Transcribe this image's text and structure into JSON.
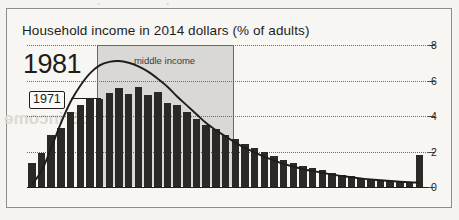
{
  "artifacts": {
    "bleed_top": "· ·",
    "bleed_middle": "ape-shifting US income distrib"
  },
  "frame": {
    "name": "scanned-figure-frame"
  },
  "chart_data": {
    "type": "bar",
    "title": "Household income in 2014 dollars (% of adults)",
    "xlabel": "",
    "ylabel": "",
    "ylim": [
      0,
      8
    ],
    "yticks": [
      0,
      2,
      4,
      6,
      8
    ],
    "grid": true,
    "legend_position": "inline-annotation",
    "annotations": [
      {
        "text": "1981",
        "role": "primary-series-label"
      },
      {
        "text": "1971",
        "role": "secondary-series-label"
      },
      {
        "text": "middle income",
        "role": "shaded-band-label"
      }
    ],
    "xtick_labels": [
      "$0k",
      "$50k",
      "$100k",
      "$150k",
      "$200k+"
    ],
    "xtick_values": [
      0,
      50,
      100,
      150,
      200
    ],
    "xlim": [
      0,
      207
    ],
    "band": {
      "label": "middle income",
      "x_start": 36,
      "x_end": 106
    },
    "series": [
      {
        "name": "1981",
        "type": "bar",
        "bin_width": 5,
        "x": [
          0,
          5,
          10,
          15,
          20,
          25,
          30,
          35,
          40,
          45,
          50,
          55,
          60,
          65,
          70,
          75,
          80,
          85,
          90,
          95,
          100,
          105,
          110,
          115,
          120,
          125,
          130,
          135,
          140,
          145,
          150,
          155,
          160,
          165,
          170,
          175,
          180,
          185,
          190,
          195,
          200
        ],
        "values": [
          1.35,
          1.9,
          2.95,
          3.35,
          4.25,
          4.6,
          5.0,
          4.95,
          5.3,
          5.6,
          5.25,
          5.65,
          5.2,
          5.35,
          4.75,
          4.6,
          4.25,
          3.85,
          3.5,
          3.25,
          2.95,
          2.7,
          2.45,
          2.2,
          1.95,
          1.75,
          1.55,
          1.35,
          1.2,
          1.05,
          0.95,
          0.8,
          0.7,
          0.6,
          0.5,
          0.45,
          0.4,
          0.35,
          0.3,
          0.28,
          1.8
        ]
      },
      {
        "name": "1971",
        "type": "line",
        "x": [
          0,
          5,
          10,
          15,
          20,
          25,
          30,
          35,
          40,
          45,
          50,
          55,
          60,
          65,
          70,
          75,
          80,
          85,
          90,
          95,
          100,
          105,
          110,
          115,
          120,
          125,
          130,
          135,
          140,
          145,
          150,
          155,
          160,
          165,
          170,
          175,
          180,
          185,
          190,
          195,
          200
        ],
        "values": [
          0.15,
          0.9,
          2.2,
          3.6,
          4.8,
          5.7,
          6.4,
          6.85,
          7.05,
          7.1,
          7.0,
          6.8,
          6.5,
          6.1,
          5.65,
          5.1,
          4.6,
          4.1,
          3.6,
          3.2,
          2.85,
          2.5,
          2.2,
          1.95,
          1.7,
          1.5,
          1.3,
          1.15,
          1.0,
          0.9,
          0.8,
          0.7,
          0.62,
          0.55,
          0.48,
          0.42,
          0.38,
          0.34,
          0.3,
          0.27,
          0.25
        ]
      }
    ]
  }
}
